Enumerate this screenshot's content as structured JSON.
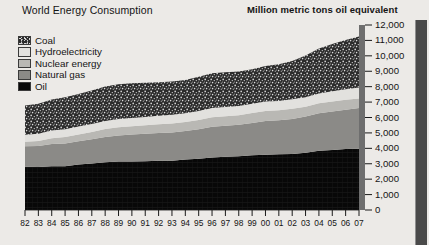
{
  "header": {
    "title": "World Energy Consumption",
    "unit_title": "Million metric tons oil equivalent"
  },
  "legend": {
    "position": "top-left",
    "items": [
      {
        "label": "Coal",
        "swatch": "coal-swatch",
        "color": "#2c2c2c"
      },
      {
        "label": "Hydroelectricity",
        "swatch": "hydroelectricity-swatch",
        "color": "#e2e1de"
      },
      {
        "label": "Nuclear energy",
        "swatch": "nuclear-energy-swatch",
        "color": "#b9b8b4"
      },
      {
        "label": "Natural gas",
        "swatch": "natural-gas-swatch",
        "color": "#8b8a87"
      },
      {
        "label": "Oil",
        "swatch": "oil-swatch",
        "color": "#090909"
      }
    ]
  },
  "chart_data": {
    "type": "area",
    "title": "World Energy Consumption",
    "subtitle": "Million metric tons oil equivalent",
    "xlabel": "",
    "ylabel": "Million metric tons oil equivalent",
    "ylim": [
      0,
      12000
    ],
    "ytick_step": 1000,
    "grid": false,
    "stacked": true,
    "legend_position": "top-left",
    "x": [
      "82",
      "83",
      "84",
      "85",
      "86",
      "87",
      "88",
      "89",
      "90",
      "91",
      "92",
      "93",
      "94",
      "95",
      "96",
      "97",
      "98",
      "99",
      "00",
      "01",
      "02",
      "03",
      "04",
      "05",
      "06",
      "07"
    ],
    "x_full": [
      1982,
      1983,
      1984,
      1985,
      1986,
      1987,
      1988,
      1989,
      1990,
      1991,
      1992,
      1993,
      1994,
      1995,
      1996,
      1997,
      1998,
      1999,
      2000,
      2001,
      2002,
      2003,
      2004,
      2005,
      2006,
      2007
    ],
    "ytick_labels": [
      "0",
      "1,000",
      "2,000",
      "3,000",
      "4,000",
      "5,000",
      "6,000",
      "7,000",
      "8,000",
      "9,000",
      "10,000",
      "11,000",
      "12,000"
    ],
    "ytick_values": [
      0,
      1000,
      2000,
      3000,
      4000,
      5000,
      6000,
      7000,
      8000,
      9000,
      10000,
      11000,
      12000
    ],
    "series": [
      {
        "name": "Oil",
        "color": "#090909",
        "values": [
          2800,
          2790,
          2840,
          2840,
          2950,
          3010,
          3100,
          3140,
          3150,
          3160,
          3200,
          3200,
          3270,
          3320,
          3400,
          3460,
          3480,
          3550,
          3590,
          3610,
          3640,
          3720,
          3850,
          3900,
          3950,
          3980
        ]
      },
      {
        "name": "Natural gas",
        "color": "#8b8a87",
        "values": [
          1330,
          1360,
          1440,
          1480,
          1510,
          1580,
          1640,
          1700,
          1750,
          1780,
          1800,
          1830,
          1850,
          1920,
          2000,
          2010,
          2050,
          2100,
          2180,
          2210,
          2270,
          2340,
          2420,
          2490,
          2550,
          2640
        ]
      },
      {
        "name": "Nuclear energy",
        "color": "#b9b8b4",
        "values": [
          290,
          320,
          380,
          420,
          440,
          470,
          510,
          520,
          530,
          550,
          560,
          580,
          590,
          600,
          620,
          610,
          620,
          640,
          650,
          650,
          660,
          640,
          650,
          650,
          650,
          620
        ]
      },
      {
        "name": "Hydroelectricity",
        "color": "#e2e1de",
        "values": [
          460,
          470,
          490,
          500,
          510,
          520,
          530,
          540,
          540,
          550,
          550,
          570,
          570,
          580,
          600,
          600,
          600,
          610,
          620,
          600,
          620,
          620,
          640,
          660,
          680,
          710
        ]
      },
      {
        "name": "Coal",
        "color": "#2c2c2c",
        "values": [
          1900,
          1950,
          2020,
          2080,
          2110,
          2170,
          2230,
          2260,
          2250,
          2210,
          2180,
          2160,
          2160,
          2220,
          2250,
          2260,
          2230,
          2230,
          2300,
          2380,
          2480,
          2700,
          2920,
          3060,
          3200,
          3310
        ]
      }
    ],
    "totals": [
      6780,
      6890,
      7170,
      7320,
      7520,
      7750,
      8010,
      8160,
      8220,
      8250,
      8290,
      8340,
      8440,
      8640,
      8870,
      8940,
      8980,
      9130,
      9340,
      9450,
      9670,
      10020,
      10480,
      10760,
      11030,
      11260
    ]
  }
}
